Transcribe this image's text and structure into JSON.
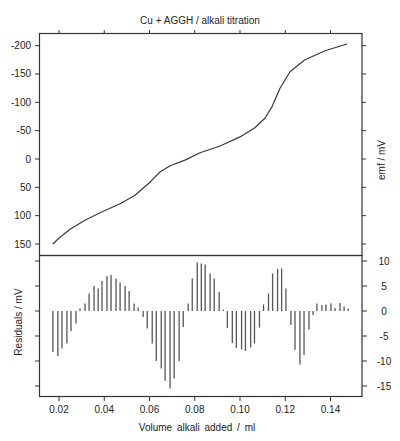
{
  "chart_data": [
    {
      "type": "line",
      "title": "Cu + AGGH / alkali titration",
      "xlabel": "Volume alkali added / ml",
      "ylabel": "emf / mV",
      "ylabel_position": "right",
      "y_inverted": true,
      "xlim": [
        0.0065,
        0.1525
      ],
      "ylim": [
        -225,
        170
      ],
      "x_ticks": [
        0.02,
        0.04,
        0.06,
        0.08,
        0.1,
        0.12,
        0.14
      ],
      "x_tick_labels": [
        "0.02",
        "0.04",
        "0.06",
        "0.08",
        "0.10",
        "0.12",
        "0.14"
      ],
      "y_ticks": [
        -200,
        -150,
        -100,
        -50,
        0,
        50,
        100,
        150
      ],
      "y_tick_labels": [
        "-200",
        "-150",
        "-100",
        "-50",
        "0",
        "50",
        "100",
        "150"
      ],
      "grid": false,
      "series": [
        {
          "name": "emf",
          "x": [
            0.0173,
            0.0204,
            0.0249,
            0.0315,
            0.0381,
            0.047,
            0.0536,
            0.0602,
            0.0646,
            0.0691,
            0.0757,
            0.0823,
            0.0912,
            0.1,
            0.1066,
            0.111,
            0.1141,
            0.1177,
            0.1221,
            0.1287,
            0.1376,
            0.1473
          ],
          "y": [
            150,
            138,
            124,
            108,
            95,
            79,
            64,
            41,
            23,
            12,
            2,
            -11,
            -23,
            -39,
            -55,
            -72,
            -92,
            -125,
            -154,
            -175,
            -191,
            -203
          ]
        }
      ]
    },
    {
      "type": "bar",
      "subtype": "stem",
      "title": "",
      "xlabel": "Volume alkali added / ml",
      "ylabel": "Residuals / mV",
      "xlim": [
        0.0065,
        0.1525
      ],
      "ylim": [
        -17,
        11
      ],
      "x_ticks": [
        0.02,
        0.04,
        0.06,
        0.08,
        0.1,
        0.12,
        0.14
      ],
      "x_tick_labels": [
        "0.02",
        "0.04",
        "0.06",
        "0.08",
        "0.10",
        "0.12",
        "0.14"
      ],
      "y_ticks": [
        10,
        5,
        0,
        -5,
        -10,
        -15
      ],
      "y_tick_labels": [
        "10",
        "5",
        "0",
        "-5",
        "-10",
        "-15"
      ],
      "y_tick_position": "right",
      "grid": false,
      "series": [
        {
          "name": "residuals",
          "x": [
            0.0173,
            0.0195,
            0.0213,
            0.0235,
            0.0253,
            0.0275,
            0.0293,
            0.0315,
            0.0333,
            0.0355,
            0.0373,
            0.039,
            0.0412,
            0.043,
            0.0452,
            0.047,
            0.0492,
            0.051,
            0.0532,
            0.055,
            0.0572,
            0.059,
            0.0612,
            0.063,
            0.0652,
            0.0669,
            0.0691,
            0.0709,
            0.0731,
            0.0749,
            0.0771,
            0.0789,
            0.0811,
            0.0829,
            0.0846,
            0.0868,
            0.0886,
            0.0908,
            0.0926,
            0.0944,
            0.0966,
            0.0984,
            0.1007,
            0.1024,
            0.1047,
            0.1064,
            0.1086,
            0.1104,
            0.1126,
            0.1144,
            0.1166,
            0.1184,
            0.1203,
            0.1225,
            0.1243,
            0.1265,
            0.1283,
            0.1305,
            0.1323,
            0.134,
            0.1362,
            0.138,
            0.1402,
            0.142,
            0.1442,
            0.146,
            0.1478
          ],
          "y": [
            -8.2,
            -9.0,
            -7.5,
            -6.5,
            -4.0,
            -2.5,
            0.5,
            1.5,
            3.5,
            5.0,
            4.5,
            6.0,
            7.0,
            7.2,
            6.5,
            5.7,
            5.0,
            4.0,
            1.5,
            0.7,
            -1.2,
            -3.5,
            -6.5,
            -10.0,
            -11.5,
            -14.0,
            -15.5,
            -13.5,
            -10.0,
            -3.2,
            1.5,
            6.5,
            9.7,
            9.5,
            9.3,
            7.5,
            6.5,
            3.8,
            0.3,
            -3.4,
            -6.4,
            -7.4,
            -7.7,
            -8.0,
            -7.3,
            -6.5,
            -3.3,
            1.3,
            3.5,
            7.5,
            8.4,
            8.5,
            4.5,
            -2.8,
            -7.8,
            -10.7,
            -8.8,
            -3.7,
            -0.8,
            1.5,
            1.2,
            1.3,
            1.5,
            0.6,
            1.6,
            0.9,
            0.5
          ]
        }
      ]
    }
  ]
}
